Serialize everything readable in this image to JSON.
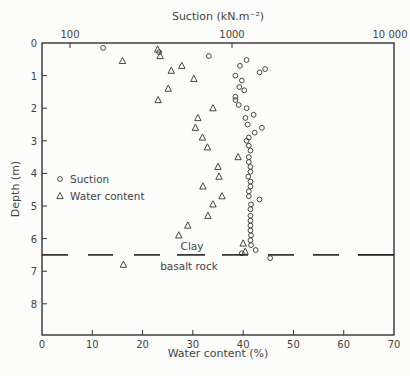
{
  "chart_data": {
    "type": "scatter",
    "title": "",
    "top_axis": {
      "label": "Suction (kN.m⁻²)",
      "scale": "log",
      "ticks": [
        {
          "value": 100,
          "label": "100"
        },
        {
          "value": 1000,
          "label": "1000"
        },
        {
          "value": 10000,
          "label": "10 000"
        }
      ],
      "range": [
        67,
        10000
      ]
    },
    "bottom_axis": {
      "label": "Water content  (%)",
      "scale": "linear",
      "ticks": [
        0,
        10,
        20,
        30,
        40,
        50,
        60,
        70
      ],
      "range": [
        0,
        70
      ]
    },
    "left_axis": {
      "label": "Depth  (m)",
      "ticks": [
        0,
        1,
        2,
        3,
        4,
        5,
        6,
        7,
        8
      ],
      "range": [
        0,
        9
      ],
      "inverted": true
    },
    "legend": [
      {
        "symbol": "circle",
        "label": "Suction"
      },
      {
        "symbol": "triangle",
        "label": "Water content"
      }
    ],
    "annotations": [
      {
        "text": "Clay",
        "depth": 6.3
      },
      {
        "text": "basalt rock",
        "depth": 6.75
      }
    ],
    "boundary_depth_m": 6.5,
    "series": [
      {
        "name": "Suction",
        "axis": "top",
        "unit": "kN/m2",
        "points": [
          {
            "depth": 0.15,
            "value": 160
          },
          {
            "depth": 0.28,
            "value": 355
          },
          {
            "depth": 0.4,
            "value": 720
          },
          {
            "depth": 0.52,
            "value": 1230
          },
          {
            "depth": 0.7,
            "value": 1120
          },
          {
            "depth": 0.8,
            "value": 1600
          },
          {
            "depth": 0.9,
            "value": 1480
          },
          {
            "depth": 1.0,
            "value": 1050
          },
          {
            "depth": 1.15,
            "value": 1150
          },
          {
            "depth": 1.35,
            "value": 1110
          },
          {
            "depth": 1.45,
            "value": 1190
          },
          {
            "depth": 1.65,
            "value": 1050
          },
          {
            "depth": 1.75,
            "value": 1050
          },
          {
            "depth": 1.9,
            "value": 1100
          },
          {
            "depth": 2.0,
            "value": 1230
          },
          {
            "depth": 2.2,
            "value": 1360
          },
          {
            "depth": 2.3,
            "value": 1210
          },
          {
            "depth": 2.5,
            "value": 1250
          },
          {
            "depth": 2.6,
            "value": 1530
          },
          {
            "depth": 2.75,
            "value": 1380
          },
          {
            "depth": 2.9,
            "value": 1270
          },
          {
            "depth": 3.0,
            "value": 1230
          },
          {
            "depth": 3.15,
            "value": 1270
          },
          {
            "depth": 3.3,
            "value": 1300
          },
          {
            "depth": 3.5,
            "value": 1270
          },
          {
            "depth": 3.65,
            "value": 1270
          },
          {
            "depth": 3.8,
            "value": 1300
          },
          {
            "depth": 3.95,
            "value": 1300
          },
          {
            "depth": 4.1,
            "value": 1260
          },
          {
            "depth": 4.25,
            "value": 1300
          },
          {
            "depth": 4.4,
            "value": 1300
          },
          {
            "depth": 4.55,
            "value": 1270
          },
          {
            "depth": 4.7,
            "value": 1270
          },
          {
            "depth": 4.8,
            "value": 1480
          },
          {
            "depth": 4.95,
            "value": 1310
          },
          {
            "depth": 5.1,
            "value": 1300
          },
          {
            "depth": 5.3,
            "value": 1300
          },
          {
            "depth": 5.45,
            "value": 1300
          },
          {
            "depth": 5.6,
            "value": 1300
          },
          {
            "depth": 5.75,
            "value": 1300
          },
          {
            "depth": 5.9,
            "value": 1310
          },
          {
            "depth": 6.05,
            "value": 1300
          },
          {
            "depth": 6.2,
            "value": 1310
          },
          {
            "depth": 6.35,
            "value": 1400
          },
          {
            "depth": 6.45,
            "value": 1150
          },
          {
            "depth": 6.6,
            "value": 1720
          }
        ]
      },
      {
        "name": "Water content",
        "axis": "bottom",
        "unit": "%",
        "points": [
          {
            "depth": 0.2,
            "value": 23.0
          },
          {
            "depth": 0.4,
            "value": 23.5
          },
          {
            "depth": 0.55,
            "value": 16.0
          },
          {
            "depth": 0.7,
            "value": 27.8
          },
          {
            "depth": 0.85,
            "value": 25.7
          },
          {
            "depth": 1.1,
            "value": 30.2
          },
          {
            "depth": 1.4,
            "value": 25.1
          },
          {
            "depth": 1.75,
            "value": 23.1
          },
          {
            "depth": 2.0,
            "value": 34.0
          },
          {
            "depth": 2.3,
            "value": 31.0
          },
          {
            "depth": 2.6,
            "value": 30.5
          },
          {
            "depth": 2.9,
            "value": 31.9
          },
          {
            "depth": 3.2,
            "value": 32.9
          },
          {
            "depth": 3.5,
            "value": 39.0
          },
          {
            "depth": 3.8,
            "value": 35.0
          },
          {
            "depth": 4.1,
            "value": 35.2
          },
          {
            "depth": 4.4,
            "value": 32.0
          },
          {
            "depth": 4.7,
            "value": 35.8
          },
          {
            "depth": 4.95,
            "value": 34.0
          },
          {
            "depth": 5.3,
            "value": 33.0
          },
          {
            "depth": 5.6,
            "value": 29.0
          },
          {
            "depth": 5.9,
            "value": 27.2
          },
          {
            "depth": 6.15,
            "value": 40.0
          },
          {
            "depth": 6.4,
            "value": 40.4
          },
          {
            "depth": 6.8,
            "value": 16.2
          }
        ]
      }
    ]
  }
}
